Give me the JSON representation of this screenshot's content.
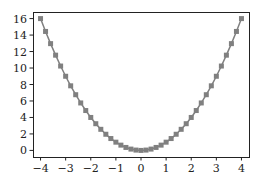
{
  "chart_data": {
    "type": "line",
    "title": "",
    "xlabel": "",
    "ylabel": "",
    "xlim": [
      -4.3,
      4.3
    ],
    "ylim": [
      -0.8,
      16.8
    ],
    "grid": false,
    "legend": null,
    "xticks": [
      -4,
      -3,
      -2,
      -1,
      0,
      1,
      2,
      3,
      4
    ],
    "xtick_labels": [
      "−4",
      "−3",
      "−2",
      "−1",
      "0",
      "1",
      "2",
      "3",
      "4"
    ],
    "yticks": [
      0,
      2,
      4,
      6,
      8,
      10,
      12,
      14,
      16
    ],
    "ytick_labels": [
      "0",
      "2",
      "4",
      "6",
      "8",
      "10",
      "12",
      "14",
      "16"
    ],
    "series": [
      {
        "name": "y = x^2",
        "color": "#808080",
        "marker": "square",
        "x": [
          -4.0,
          -3.8,
          -3.6,
          -3.4,
          -3.2,
          -3.0,
          -2.8,
          -2.6,
          -2.4,
          -2.2,
          -2.0,
          -1.8,
          -1.6,
          -1.4,
          -1.2,
          -1.0,
          -0.8,
          -0.6,
          -0.4,
          -0.2,
          0.0,
          0.2,
          0.4,
          0.6,
          0.8,
          1.0,
          1.2,
          1.4,
          1.6,
          1.8,
          2.0,
          2.2,
          2.4,
          2.6,
          2.8,
          3.0,
          3.2,
          3.4,
          3.6,
          3.8,
          4.0
        ],
        "values": [
          16.0,
          14.44,
          12.96,
          11.56,
          10.24,
          9.0,
          7.84,
          6.76,
          5.76,
          4.84,
          4.0,
          3.24,
          2.56,
          1.96,
          1.44,
          1.0,
          0.64,
          0.36,
          0.16,
          0.04,
          0.0,
          0.04,
          0.16,
          0.36,
          0.64,
          1.0,
          1.44,
          1.96,
          2.56,
          3.24,
          4.0,
          4.84,
          5.76,
          6.76,
          7.84,
          9.0,
          10.24,
          11.56,
          12.96,
          14.44,
          16.0
        ]
      }
    ]
  },
  "layout": {
    "axes_box": {
      "left": 33,
      "top": 12,
      "right": 249,
      "bottom": 157
    },
    "axis_color": "#222222"
  }
}
